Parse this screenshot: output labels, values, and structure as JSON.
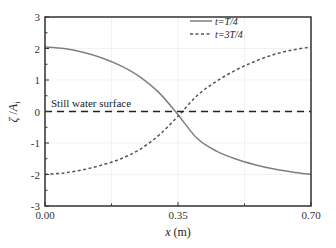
{
  "chart_data": {
    "type": "line",
    "title": "",
    "xlabel": "x (m)",
    "ylabel": "ζ / A_i",
    "xlim": [
      0,
      0.7
    ],
    "ylim": [
      -3,
      3
    ],
    "xticks": [
      "0.00",
      "0.35",
      "0.70"
    ],
    "yticks": [
      "-3",
      "-2",
      "-1",
      "0",
      "1",
      "2",
      "3"
    ],
    "grid": true,
    "legend_position": "upper right",
    "annotations": [
      {
        "text": "Still water surface",
        "x": 0.02,
        "y": 0.2
      }
    ],
    "series": [
      {
        "name": "t=T/4",
        "style": "solid",
        "color": "#7f7f7f",
        "x": [
          0.0,
          0.05,
          0.1,
          0.15,
          0.2,
          0.25,
          0.3,
          0.35,
          0.4,
          0.45,
          0.5,
          0.55,
          0.6,
          0.65,
          0.7
        ],
        "y": [
          2.05,
          2.0,
          1.88,
          1.7,
          1.45,
          1.1,
          0.6,
          -0.1,
          -0.85,
          -1.25,
          -1.5,
          -1.68,
          -1.82,
          -1.92,
          -2.0
        ]
      },
      {
        "name": "t=3T/4",
        "style": "dotted",
        "color": "#555555",
        "x": [
          0.0,
          0.05,
          0.1,
          0.15,
          0.2,
          0.25,
          0.3,
          0.35,
          0.4,
          0.45,
          0.5,
          0.55,
          0.6,
          0.65,
          0.7
        ],
        "y": [
          -2.0,
          -1.95,
          -1.85,
          -1.7,
          -1.5,
          -1.2,
          -0.75,
          -0.15,
          0.5,
          0.95,
          1.3,
          1.58,
          1.8,
          1.95,
          2.05
        ]
      },
      {
        "name": "Still water surface",
        "style": "dashed",
        "color": "#222222",
        "x": [
          0.0,
          0.7
        ],
        "y": [
          0,
          0
        ]
      }
    ]
  },
  "labels": {
    "xlabel_var": "x",
    "xlabel_unit": " (m)",
    "ylabel_zeta": "ζ",
    "ylabel_slash": " /",
    "ylabel_A": "A",
    "ylabel_sub": "i",
    "legend_1": "t=T/4",
    "legend_2": "t=3T/4",
    "annotation": "Still water surface"
  }
}
